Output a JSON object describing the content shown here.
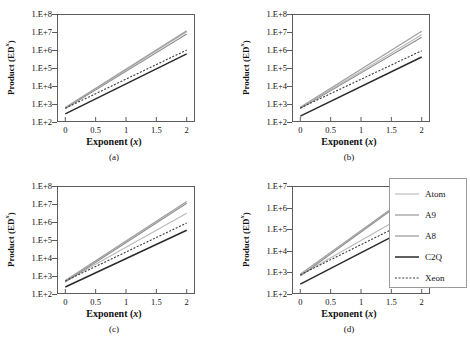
{
  "figure": {
    "background": "#ffffff",
    "panels": [
      "a",
      "b",
      "c",
      "d"
    ]
  },
  "axis_titles": {
    "y_prefix": "Product  (ED",
    "y_superscript": "x",
    "y_suffix": ")",
    "x_prefix": "Exponent (",
    "x_italic": "x",
    "x_suffix": ")"
  },
  "captions": {
    "a": "(a)",
    "b": "(b)",
    "c": "(c)",
    "d": "(d)"
  },
  "legend": {
    "position": "right-bottom",
    "entries": [
      {
        "label": "Atom",
        "color": "#b9b9b9",
        "width": 1.1,
        "dash": "none"
      },
      {
        "label": "A9",
        "color": "#8e8e8e",
        "width": 1.1,
        "dash": "none"
      },
      {
        "label": "A8",
        "color": "#a0a0a0",
        "width": 1.3,
        "dash": "none"
      },
      {
        "label": "C2Q",
        "color": "#2b2b2b",
        "width": 1.5,
        "dash": "none"
      },
      {
        "label": "Xeon",
        "color": "#3a3a3a",
        "width": 1.1,
        "dash": "2,1.6"
      }
    ]
  },
  "chart_data": [
    {
      "type": "line",
      "title": "(a)",
      "xlabel": "Exponent (x)",
      "ylabel": "Product (ED^x)",
      "xlim": [
        -0.12,
        2.12
      ],
      "ylim": [
        2,
        8
      ],
      "yscale": "log10",
      "xticks": [
        0,
        0.5,
        1,
        1.5,
        2
      ],
      "xticklabels": [
        "0",
        "0.5",
        "1",
        "1.5",
        "2"
      ],
      "yticks": [
        2,
        3,
        4,
        5,
        6,
        7,
        8
      ],
      "yticklabels": [
        "1.E+2",
        "1.E+3",
        "1.E+4",
        "1.E+5",
        "1.E+6",
        "1.E+7",
        "1.E+8"
      ],
      "grid": false,
      "x": [
        0,
        2
      ],
      "series": [
        {
          "name": "Atom",
          "values": [
            2.74,
            7.05
          ]
        },
        {
          "name": "A9",
          "values": [
            2.7,
            6.92
          ]
        },
        {
          "name": "A8",
          "values": [
            2.76,
            7.1
          ]
        },
        {
          "name": "C2Q",
          "values": [
            2.4,
            5.8
          ]
        },
        {
          "name": "Xeon",
          "values": [
            2.72,
            6.02
          ]
        }
      ]
    },
    {
      "type": "line",
      "title": "(b)",
      "xlabel": "Exponent (x)",
      "ylabel": "Product (ED^x)",
      "xlim": [
        -0.12,
        2.12
      ],
      "ylim": [
        2,
        8
      ],
      "yscale": "log10",
      "xticks": [
        0,
        0.5,
        1,
        1.5,
        2
      ],
      "xticklabels": [
        "0",
        "0.5",
        "1",
        "1.5",
        "2"
      ],
      "yticks": [
        2,
        3,
        4,
        5,
        6,
        7,
        8
      ],
      "yticklabels": [
        "1.E+2",
        "1.E+3",
        "1.E+4",
        "1.E+5",
        "1.E+6",
        "1.E+7",
        "1.E+8"
      ],
      "grid": false,
      "x": [
        0,
        2
      ],
      "series": [
        {
          "name": "Atom",
          "values": [
            2.74,
            6.88
          ]
        },
        {
          "name": "A9",
          "values": [
            2.7,
            6.74
          ]
        },
        {
          "name": "A8",
          "values": [
            2.78,
            7.08
          ]
        },
        {
          "name": "C2Q",
          "values": [
            2.28,
            5.62
          ]
        },
        {
          "name": "Xeon",
          "values": [
            2.74,
            5.98
          ]
        }
      ]
    },
    {
      "type": "line",
      "title": "(c)",
      "xlabel": "Exponent (x)",
      "ylabel": "Product (ED^x)",
      "xlim": [
        -0.12,
        2.12
      ],
      "ylim": [
        2,
        8
      ],
      "yscale": "log10",
      "xticks": [
        0,
        0.5,
        1,
        1.5,
        2
      ],
      "xticklabels": [
        "0",
        "0.5",
        "1",
        "1.5",
        "2"
      ],
      "yticks": [
        2,
        3,
        4,
        5,
        6,
        7,
        8
      ],
      "yticklabels": [
        "1.E+2",
        "1.E+3",
        "1.E+4",
        "1.E+5",
        "1.E+6",
        "1.E+7",
        "1.E+8"
      ],
      "grid": false,
      "x": [
        0,
        2
      ],
      "series": [
        {
          "name": "Atom",
          "values": [
            2.66,
            6.52
          ]
        },
        {
          "name": "A9",
          "values": [
            2.62,
            7.08
          ]
        },
        {
          "name": "A8",
          "values": [
            2.7,
            7.18
          ]
        },
        {
          "name": "C2Q",
          "values": [
            2.34,
            5.55
          ]
        },
        {
          "name": "Xeon",
          "values": [
            2.68,
            5.96
          ]
        }
      ]
    },
    {
      "type": "line",
      "title": "(d)",
      "xlabel": "Exponent (x)",
      "ylabel": "Product (ED^x)",
      "xlim": [
        -0.12,
        2.12
      ],
      "ylim": [
        2,
        7
      ],
      "yscale": "log10",
      "xticks": [
        0,
        0.5,
        1,
        1.5,
        2
      ],
      "xticklabels": [
        "0",
        "0.5",
        "1",
        "1.5",
        "2"
      ],
      "yticks": [
        2,
        3,
        4,
        5,
        6,
        7
      ],
      "yticklabels": [
        "1.E+2",
        "1.E+3",
        "1.E+4",
        "1.E+5",
        "1.E+6",
        "1.E+7"
      ],
      "grid": false,
      "x": [
        0,
        2
      ],
      "series": [
        {
          "name": "Atom",
          "values": [
            2.84,
            6.12
          ]
        },
        {
          "name": "A9",
          "values": [
            2.8,
            6.95
          ]
        },
        {
          "name": "A8",
          "values": [
            2.88,
            7.0
          ]
        },
        {
          "name": "C2Q",
          "values": [
            2.42,
            5.38
          ]
        },
        {
          "name": "Xeon",
          "values": [
            2.86,
            5.7
          ]
        }
      ]
    }
  ]
}
